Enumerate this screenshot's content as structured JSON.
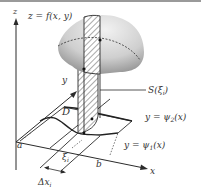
{
  "diagram": {
    "labels": {
      "z_axis": "z",
      "y_axis": "y",
      "x_axis": "x",
      "surface": "z = f(x, y)",
      "cross_section": "S(ξ",
      "cross_section_sub": "i",
      "cross_section_close": ")",
      "region": "D",
      "upper_curve": "y = ψ",
      "upper_curve_sub": "2",
      "upper_curve_arg": "(x)",
      "lower_curve": "y = ψ",
      "lower_curve_sub": "1",
      "lower_curve_arg": "(x)",
      "a": "a",
      "b": "b",
      "xi": "ξ",
      "xi_sub": "i",
      "dx": "Δx",
      "dx_sub": "i"
    },
    "colors": {
      "ink": "#2b2b2b",
      "surface_light": "#e6e6e6",
      "surface_dark": "#9e9e9e",
      "hatch": "#555555",
      "border": "#9a9a9a"
    }
  }
}
